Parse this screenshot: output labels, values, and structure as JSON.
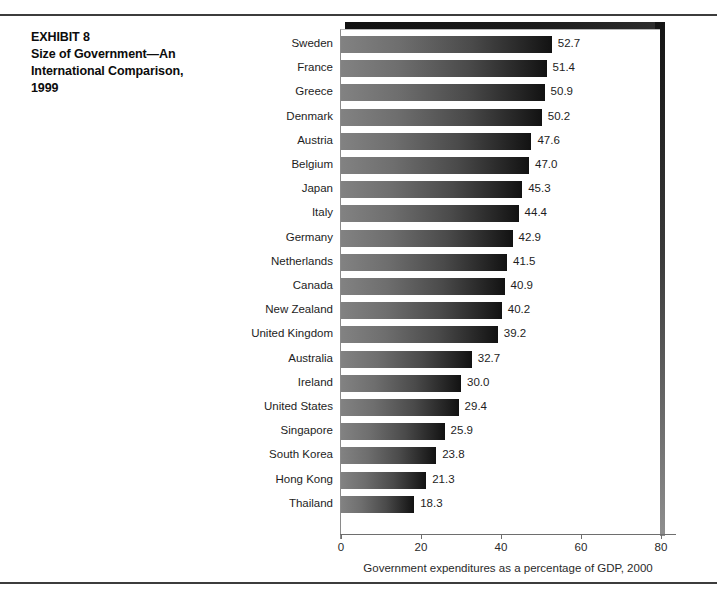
{
  "exhibit": {
    "lines": [
      "EXHIBIT 8",
      "Size of Government—An",
      "International Comparison,",
      "1999"
    ],
    "line0": "EXHIBIT 8",
    "line1": "Size of Government—An",
    "line2": "International Comparison,",
    "line3": "1999"
  },
  "chart_data": {
    "type": "bar",
    "orientation": "horizontal",
    "title": "Size of Government—An International Comparison, 1999",
    "xlabel": "Government expenditures as a percentage of GDP, 2000",
    "ylabel": "",
    "xlim": [
      0,
      80
    ],
    "xticks": [
      0,
      20,
      40,
      60,
      80
    ],
    "xtick_labels": [
      "0",
      "20",
      "40",
      "60",
      "80"
    ],
    "grid": false,
    "legend": false,
    "value_labels": true,
    "value_label_format": "one-decimal",
    "bar_fill": "gradient light-gray to black, left to right",
    "bar_color_start": "#828282",
    "bar_color_end": "#121212",
    "categories": [
      "Sweden",
      "France",
      "Greece",
      "Denmark",
      "Austria",
      "Belgium",
      "Japan",
      "Italy",
      "Germany",
      "Netherlands",
      "Canada",
      "New Zealand",
      "United Kingdom",
      "Australia",
      "Ireland",
      "United States",
      "Singapore",
      "South Korea",
      "Hong Kong",
      "Thailand"
    ],
    "values": [
      52.7,
      51.4,
      50.9,
      50.2,
      47.6,
      47.0,
      45.3,
      44.4,
      42.9,
      41.5,
      40.9,
      40.2,
      39.2,
      32.7,
      30.0,
      29.4,
      25.9,
      23.8,
      21.3,
      18.3
    ],
    "value_labels_text": [
      "52.7",
      "51.4",
      "50.9",
      "50.2",
      "47.6",
      "47.0",
      "45.3",
      "44.4",
      "42.9",
      "41.5",
      "40.9",
      "40.2",
      "39.2",
      "32.7",
      "30.0",
      "29.4",
      "25.9",
      "23.8",
      "21.3",
      "18.3"
    ]
  }
}
